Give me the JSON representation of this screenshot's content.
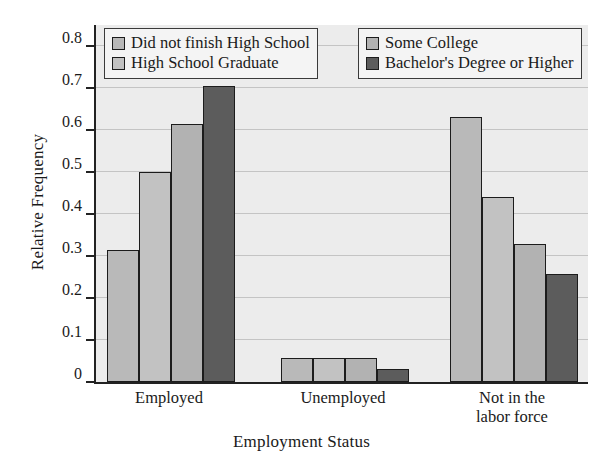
{
  "chart_data": {
    "type": "bar",
    "title": "",
    "xlabel": "Employment Status",
    "ylabel": "Relative Frequency",
    "ylim": [
      0,
      0.85
    ],
    "yticks": [
      "0",
      "0.1",
      "0.2",
      "0.3",
      "0.4",
      "0.5",
      "0.6",
      "0.7",
      "0.8"
    ],
    "ytick_values": [
      0,
      0.1,
      0.2,
      0.3,
      0.4,
      0.5,
      0.6,
      0.7,
      0.8
    ],
    "grid": true,
    "legend_position": "top-inside",
    "categories": [
      "Employed",
      "Unemployed",
      "Not in the\nlabor force"
    ],
    "series": [
      {
        "name": "Did not finish High School",
        "color": "#b9b9b9",
        "values": [
          0.315,
          0.057,
          0.63
        ]
      },
      {
        "name": "High School Graduate",
        "color": "#c2c2c2",
        "values": [
          0.5,
          0.057,
          0.44
        ]
      },
      {
        "name": "Some College",
        "color": "#b2b2b2",
        "values": [
          0.615,
          0.057,
          0.328
        ]
      },
      {
        "name": "Bachelor's Degree or Higher",
        "color": "#5c5c5c",
        "values": [
          0.705,
          0.03,
          0.258
        ]
      }
    ]
  },
  "legend": {
    "left_entries": [
      "Did not finish High School",
      "High School Graduate"
    ],
    "right_entries": [
      "Some College",
      "Bachelor's Degree or Higher"
    ]
  },
  "colors": {
    "plot_background": "#ececec",
    "gridline": "#c4c4c4",
    "axis": "#222222",
    "bar_outline": "#1c1c1c"
  }
}
